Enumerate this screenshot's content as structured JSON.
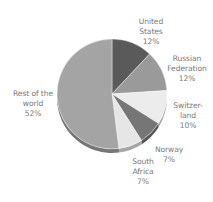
{
  "chart_data": {
    "type": "pie",
    "title": "",
    "style": "3d-tilted",
    "start_angle_deg": 0,
    "direction": "clockwise",
    "legend": "none (direct labels)",
    "slices": [
      {
        "label": "United States",
        "label_lines": [
          "United",
          "States",
          "12%"
        ],
        "value": 12,
        "color": "#5a5a5a"
      },
      {
        "label": "Russian Federation",
        "label_lines": [
          "Russian",
          "Federation",
          "12%"
        ],
        "value": 12,
        "color": "#9a9a9a"
      },
      {
        "label": "Switzerland",
        "label_lines": [
          "Switzer-",
          "land",
          "10%"
        ],
        "value": 10,
        "color": "#ececec"
      },
      {
        "label": "Norway",
        "label_lines": [
          "Norway",
          "7%"
        ],
        "value": 7,
        "color": "#767676"
      },
      {
        "label": "South Africa",
        "label_lines": [
          "South",
          "Africa",
          "7%"
        ],
        "value": 7,
        "color": "#e6e6e6"
      },
      {
        "label": "Rest of the world",
        "label_lines": [
          "Rest of the",
          "world",
          "52%"
        ],
        "value": 52,
        "color": "#a4a4a4"
      }
    ]
  },
  "labels": {
    "us": {
      "l1": "United",
      "l2": "States",
      "pct": "12%"
    },
    "ru": {
      "l1": "Russian",
      "l2": "Federation",
      "pct": "12%"
    },
    "ch": {
      "l1": "Switzer-",
      "l2": "land",
      "pct": "10%"
    },
    "no": {
      "l1": "Norway",
      "pct": "7%"
    },
    "za": {
      "l1": "South",
      "l2": "Africa",
      "pct": "7%"
    },
    "rw": {
      "l1": "Rest of the",
      "l2": "world",
      "pct": "52%"
    }
  }
}
